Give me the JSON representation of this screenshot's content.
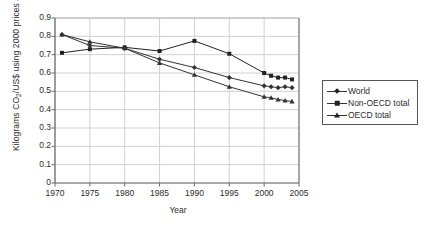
{
  "chart_data": {
    "type": "line",
    "title": "",
    "xlabel": "Year",
    "ylabel": "Kilograms CO2/US$ using 2000 prices and PPP",
    "ylabel_parts": {
      "pre": "Kilograms CO",
      "sub": "2",
      "post": "/US$ using 2000 prices and PPP"
    },
    "xlim": [
      1970,
      2005
    ],
    "ylim": [
      0,
      0.9
    ],
    "xticks": [
      1970,
      1975,
      1980,
      1985,
      1990,
      1995,
      2000,
      2005
    ],
    "yticks": [
      "0",
      "0.1",
      "0.2",
      "0.3",
      "0.4",
      "0.5",
      "0.6",
      "0.7",
      "0.8",
      "0.9"
    ],
    "ytick_values": [
      0,
      0.1,
      0.2,
      0.3,
      0.4,
      0.5,
      0.6,
      0.7,
      0.8,
      0.9
    ],
    "grid": true,
    "legend_position": "right",
    "x": [
      1971,
      1975,
      1980,
      1985,
      1990,
      1995,
      2000,
      2001,
      2002,
      2003,
      2004
    ],
    "series": [
      {
        "name": "World",
        "marker": "diamond",
        "color": "#333333",
        "values": [
          0.81,
          0.75,
          0.735,
          0.675,
          0.63,
          0.575,
          0.53,
          0.525,
          0.52,
          0.525,
          0.52
        ]
      },
      {
        "name": "Non-OECD total",
        "marker": "square",
        "color": "#222222",
        "values": [
          0.71,
          0.73,
          0.74,
          0.72,
          0.775,
          0.705,
          0.6,
          0.585,
          0.575,
          0.575,
          0.565
        ]
      },
      {
        "name": "OECD total",
        "marker": "triangle",
        "color": "#333333",
        "values": [
          0.81,
          0.77,
          0.735,
          0.655,
          0.59,
          0.525,
          0.47,
          0.465,
          0.455,
          0.45,
          0.445
        ]
      }
    ]
  },
  "legend": {
    "items": [
      {
        "label": "World"
      },
      {
        "label": "Non-OECD total"
      },
      {
        "label": "OECD total"
      }
    ]
  }
}
